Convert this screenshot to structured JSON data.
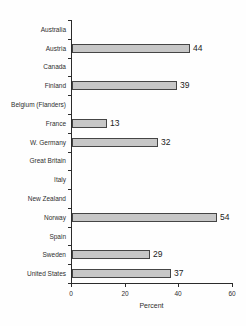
{
  "chart_data": {
    "type": "bar",
    "orientation": "horizontal",
    "title": "",
    "xlabel": "Percent",
    "ylabel": "",
    "xlim": [
      0,
      60
    ],
    "xticks": [
      0,
      20,
      40,
      60
    ],
    "grid": false,
    "legend": null,
    "categories": [
      "Australia",
      "Austria",
      "Canada",
      "Finland",
      "Belgium (Flanders)",
      "France",
      "W. Germany",
      "Great Britain",
      "Italy",
      "New Zealand",
      "Norway",
      "Spain",
      "Sweden",
      "United States"
    ],
    "values": [
      null,
      44,
      null,
      39,
      null,
      13,
      32,
      null,
      null,
      null,
      54,
      null,
      29,
      37
    ],
    "value_labels": [
      "",
      "44",
      "",
      "39",
      "",
      "13",
      "32",
      "",
      "",
      "",
      "54",
      "",
      "29",
      "37"
    ],
    "colors": {
      "bar_fill": "#c7c7c7",
      "bar_border": "#454545",
      "axis": "#2b2b2b",
      "text": "#2e2e2e",
      "background": "#fefefe"
    }
  }
}
